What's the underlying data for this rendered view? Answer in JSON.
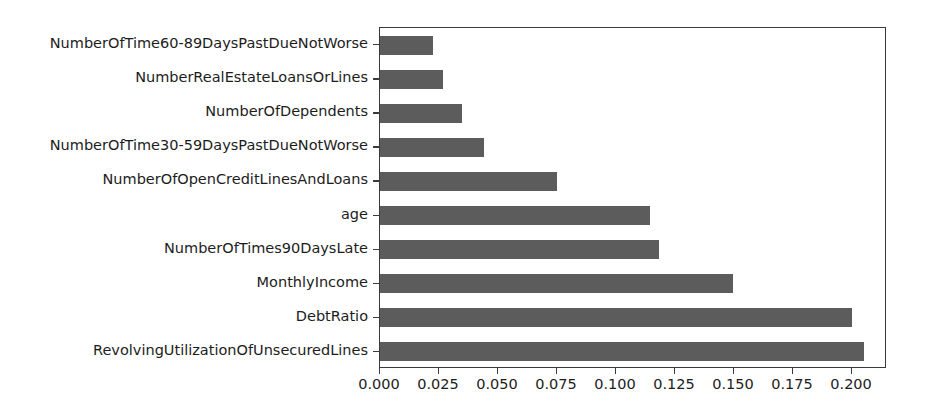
{
  "chart_data": {
    "type": "bar",
    "orientation": "horizontal",
    "title": "",
    "subtitle": "",
    "xlabel": "",
    "ylabel": "",
    "xlim": [
      0.0,
      0.2148
    ],
    "grid": false,
    "legend": null,
    "bar_color": "#5c5c5c",
    "axis_color": "#3a3a3a",
    "text_color": "#1c1c1c",
    "categories": [
      "NumberOfTime60-89DaysPastDueNotWorse",
      "NumberRealEstateLoansOrLines",
      "NumberOfDependents",
      "NumberOfTime30-59DaysPastDueNotWorse",
      "NumberOfOpenCreditLinesAndLoans",
      "age",
      "NumberOfTimes90DaysLate",
      "MonthlyIncome",
      "DebtRatio",
      "RevolvingUtilizationOfUnsecuredLines"
    ],
    "values": [
      0.0225,
      0.0267,
      0.0349,
      0.0441,
      0.075,
      0.1144,
      0.1182,
      0.1496,
      0.2,
      0.2051
    ],
    "xticks": [
      0.0,
      0.025,
      0.05,
      0.075,
      0.1,
      0.125,
      0.15,
      0.175,
      0.2
    ],
    "xticklabels": [
      "0.000",
      "0.025",
      "0.050",
      "0.075",
      "0.100",
      "0.125",
      "0.150",
      "0.175",
      "0.200"
    ]
  }
}
